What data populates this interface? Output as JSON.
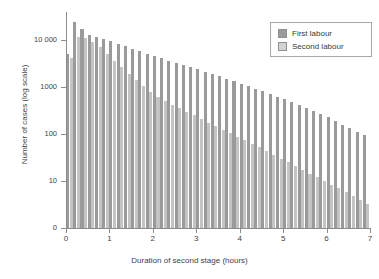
{
  "chart_data": {
    "type": "bar",
    "title": "",
    "subtitle": "",
    "xlabel": "Duration of second stage (hours)",
    "ylabel": "Number of cases (log scale)",
    "yscale": "log",
    "ylim": [
      1,
      40000
    ],
    "xlim": [
      0,
      7
    ],
    "grid": false,
    "legend_position": "top-right",
    "bar_width_hours": 0.1667,
    "y_tick_labels": [
      "0",
      "10",
      "100",
      "1000",
      "10 000"
    ],
    "y_tick_values": [
      0,
      10,
      100,
      1000,
      10000
    ],
    "x_tick_labels": [
      "0",
      "1",
      "2",
      "3",
      "4",
      "5",
      "6",
      "7"
    ],
    "x_tick_values": [
      0,
      1,
      2,
      3,
      4,
      5,
      6,
      7
    ],
    "x": [
      0.083,
      0.25,
      0.417,
      0.583,
      0.75,
      0.917,
      1.083,
      1.25,
      1.417,
      1.583,
      1.75,
      1.917,
      2.083,
      2.25,
      2.417,
      2.583,
      2.75,
      2.917,
      3.083,
      3.25,
      3.417,
      3.583,
      3.75,
      3.917,
      4.083,
      4.25,
      4.417,
      4.583,
      4.75,
      4.917,
      5.083,
      5.25,
      5.417,
      5.583,
      5.75,
      5.917,
      6.083,
      6.25,
      6.417,
      6.583,
      6.75,
      6.917
    ],
    "series": [
      {
        "name": "First labour",
        "color": "#9a9a9a",
        "values": [
          5200,
          25000,
          17000,
          13000,
          11500,
          10500,
          9500,
          8200,
          7400,
          6600,
          5900,
          5200,
          4700,
          4200,
          3700,
          3300,
          2950,
          2650,
          2400,
          2150,
          1900,
          1700,
          1500,
          1350,
          1180,
          1050,
          930,
          820,
          720,
          630,
          550,
          480,
          420,
          360,
          310,
          265,
          230,
          190,
          160,
          135,
          112,
          95
        ]
      },
      {
        "name": "Second labour",
        "color": "#c4c4c4",
        "values": [
          4200,
          12000,
          11000,
          9000,
          7200,
          5200,
          3700,
          2700,
          1900,
          1400,
          1050,
          800,
          620,
          500,
          420,
          360,
          300,
          250,
          210,
          175,
          150,
          125,
          105,
          88,
          74,
          62,
          52,
          43,
          36,
          30,
          25,
          21,
          17,
          14.5,
          12,
          10,
          8.4,
          7,
          5.8,
          4.8,
          4,
          3.3
        ]
      }
    ]
  },
  "legend": {
    "items": [
      {
        "label": "First labour",
        "color": "#9a9a9a"
      },
      {
        "label": "Second labour",
        "color": "#d2d2d2"
      }
    ]
  },
  "axes": {
    "x_title": "Duration of second stage (hours)",
    "y_title": "Number of cases (log scale)"
  }
}
